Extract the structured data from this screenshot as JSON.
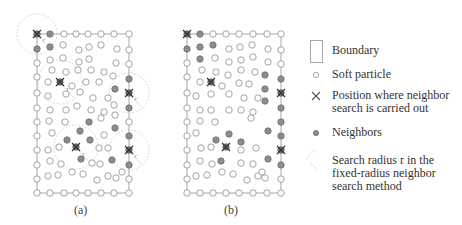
{
  "figure": {
    "panel_a": {
      "label": "(a)",
      "boundary": {
        "x": 37,
        "y": 34,
        "w": 92,
        "h": 159
      },
      "search_points": [
        [
          37,
          34
        ],
        [
          60,
          82
        ],
        [
          129,
          93
        ],
        [
          76,
          147
        ],
        [
          129,
          150
        ]
      ],
      "neighbors": [
        [
          50,
          34
        ],
        [
          37,
          49
        ],
        [
          50,
          47
        ],
        [
          129,
          79
        ],
        [
          115,
          89
        ],
        [
          129,
          108
        ],
        [
          115,
          128
        ],
        [
          129,
          136
        ],
        [
          129,
          165
        ],
        [
          67,
          140
        ],
        [
          80,
          131
        ],
        [
          89,
          122
        ],
        [
          90,
          140
        ],
        [
          81,
          159
        ],
        [
          112,
          160
        ]
      ],
      "particles": [
        [
          64,
          34
        ],
        [
          76,
          34
        ],
        [
          88,
          34
        ],
        [
          101,
          34
        ],
        [
          114,
          34
        ],
        [
          129,
          34
        ],
        [
          37,
          63
        ],
        [
          37,
          77
        ],
        [
          37,
          93
        ],
        [
          37,
          108
        ],
        [
          37,
          122
        ],
        [
          37,
          136
        ],
        [
          37,
          150
        ],
        [
          37,
          165
        ],
        [
          37,
          179
        ],
        [
          37,
          193
        ],
        [
          50,
          193
        ],
        [
          64,
          193
        ],
        [
          76,
          193
        ],
        [
          88,
          193
        ],
        [
          101,
          193
        ],
        [
          114,
          193
        ],
        [
          129,
          193
        ],
        [
          129,
          50
        ],
        [
          129,
          64
        ],
        [
          129,
          122
        ],
        [
          129,
          179
        ],
        [
          63,
          45
        ],
        [
          79,
          50
        ],
        [
          89,
          47
        ],
        [
          101,
          45
        ],
        [
          117,
          49
        ],
        [
          50,
          60
        ],
        [
          63,
          58
        ],
        [
          79,
          62
        ],
        [
          89,
          59
        ],
        [
          116,
          63
        ],
        [
          52,
          70
        ],
        [
          66,
          72
        ],
        [
          78,
          70
        ],
        [
          91,
          70
        ],
        [
          104,
          72
        ],
        [
          113,
          76
        ],
        [
          48,
          82
        ],
        [
          72,
          86
        ],
        [
          86,
          82
        ],
        [
          99,
          82
        ],
        [
          48,
          96
        ],
        [
          66,
          94
        ],
        [
          80,
          92
        ],
        [
          93,
          98
        ],
        [
          108,
          98
        ],
        [
          114,
          105
        ],
        [
          50,
          110
        ],
        [
          66,
          110
        ],
        [
          77,
          106
        ],
        [
          91,
          110
        ],
        [
          104,
          112
        ],
        [
          49,
          121
        ],
        [
          65,
          122
        ],
        [
          101,
          118
        ],
        [
          115,
          115
        ],
        [
          52,
          133
        ],
        [
          104,
          135
        ],
        [
          48,
          150
        ],
        [
          59,
          147
        ],
        [
          99,
          148
        ],
        [
          108,
          148
        ],
        [
          50,
          161
        ],
        [
          61,
          164
        ],
        [
          92,
          163
        ],
        [
          100,
          164
        ],
        [
          48,
          176
        ],
        [
          58,
          175
        ],
        [
          72,
          172
        ],
        [
          83,
          174
        ],
        [
          97,
          180
        ],
        [
          108,
          176
        ],
        [
          116,
          178
        ],
        [
          122,
          172
        ]
      ],
      "radius_circles": [
        [
          37,
          34,
          20
        ],
        [
          60,
          82,
          22
        ],
        [
          129,
          93,
          20
        ],
        [
          76,
          147,
          22
        ],
        [
          129,
          150,
          20
        ]
      ]
    },
    "panel_b": {
      "label": "(b)",
      "boundary": {
        "x": 187,
        "y": 34,
        "w": 94,
        "h": 159
      },
      "search_points": [
        [
          187,
          34
        ],
        [
          211,
          82
        ],
        [
          281,
          93
        ],
        [
          226,
          147
        ],
        [
          281,
          150
        ]
      ],
      "neighbors": [
        [
          200,
          34
        ],
        [
          187,
          49
        ],
        [
          200,
          47
        ],
        [
          213,
          45
        ],
        [
          200,
          59
        ],
        [
          265,
          75
        ],
        [
          281,
          79
        ],
        [
          265,
          89
        ],
        [
          281,
          108
        ],
        [
          265,
          101
        ],
        [
          281,
          122
        ],
        [
          281,
          165
        ],
        [
          216,
          140
        ],
        [
          229,
          134
        ],
        [
          241,
          142
        ],
        [
          221,
          161
        ],
        [
          268,
          159
        ],
        [
          281,
          136
        ],
        [
          268,
          131
        ]
      ],
      "particles": [
        [
          213,
          34
        ],
        [
          226,
          34
        ],
        [
          239,
          34
        ],
        [
          253,
          34
        ],
        [
          267,
          34
        ],
        [
          281,
          34
        ],
        [
          187,
          63
        ],
        [
          187,
          77
        ],
        [
          187,
          93
        ],
        [
          187,
          108
        ],
        [
          187,
          122
        ],
        [
          187,
          136
        ],
        [
          187,
          150
        ],
        [
          187,
          165
        ],
        [
          187,
          179
        ],
        [
          187,
          193
        ],
        [
          200,
          193
        ],
        [
          213,
          193
        ],
        [
          226,
          193
        ],
        [
          239,
          193
        ],
        [
          253,
          193
        ],
        [
          267,
          193
        ],
        [
          281,
          193
        ],
        [
          281,
          50
        ],
        [
          281,
          64
        ],
        [
          281,
          179
        ],
        [
          229,
          49
        ],
        [
          240,
          47
        ],
        [
          252,
          45
        ],
        [
          268,
          49
        ],
        [
          215,
          58
        ],
        [
          229,
          62
        ],
        [
          241,
          60
        ],
        [
          253,
          57
        ],
        [
          268,
          62
        ],
        [
          202,
          70
        ],
        [
          216,
          72
        ],
        [
          228,
          75
        ],
        [
          241,
          70
        ],
        [
          255,
          72
        ],
        [
          200,
          82
        ],
        [
          222,
          86
        ],
        [
          239,
          83
        ],
        [
          249,
          84
        ],
        [
          196,
          96
        ],
        [
          211,
          94
        ],
        [
          229,
          94
        ],
        [
          244,
          98
        ],
        [
          258,
          98
        ],
        [
          200,
          110
        ],
        [
          211,
          110
        ],
        [
          229,
          110
        ],
        [
          241,
          110
        ],
        [
          253,
          112
        ],
        [
          200,
          121
        ],
        [
          215,
          122
        ],
        [
          251,
          118
        ],
        [
          196,
          133
        ],
        [
          201,
          148
        ],
        [
          211,
          147
        ],
        [
          241,
          150
        ],
        [
          256,
          148
        ],
        [
          200,
          161
        ],
        [
          212,
          164
        ],
        [
          241,
          163
        ],
        [
          253,
          164
        ],
        [
          196,
          176
        ],
        [
          207,
          175
        ],
        [
          222,
          172
        ],
        [
          233,
          174
        ],
        [
          247,
          180
        ],
        [
          258,
          176
        ],
        [
          265,
          178
        ],
        [
          262,
          172
        ]
      ]
    }
  },
  "legend": {
    "items": [
      {
        "symbol": "boundary-rect",
        "text_lines": [
          "Boundary"
        ]
      },
      {
        "symbol": "soft-particle",
        "text_lines": [
          "Soft particle"
        ]
      },
      {
        "symbol": "search-position",
        "text_lines": [
          "Position where neighbor",
          "search is carried out"
        ]
      },
      {
        "symbol": "neighbor",
        "text_lines": [
          "Neighbors"
        ]
      },
      {
        "symbol": "search-radius",
        "text_lines": [
          "Search radius r in the",
          "fixed-radius neighbor",
          "search method"
        ]
      }
    ]
  },
  "labels": {
    "radius_symbol": "r"
  },
  "colors": {
    "particle_stroke": "#9a9a9a",
    "neighbor_fill": "#8c8c8c",
    "neighbor_stroke": "#6e6e6e",
    "boundary": "#a8a8a8",
    "cross": "#333333",
    "radius_circle": "#cfcfcf"
  }
}
